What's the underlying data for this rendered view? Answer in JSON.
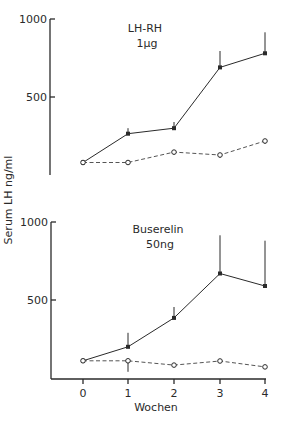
{
  "chart_data": [
    {
      "type": "line",
      "title": "LH-RH 1µg",
      "panel_label_line1": "LH-RH",
      "panel_label_line2": "1µg",
      "xlabel": "Wochen",
      "ylabel": "Serum LH ng/ml",
      "x": [
        0,
        1,
        2,
        3,
        4
      ],
      "ylim": [
        0,
        1000
      ],
      "yticks": [
        500,
        1000
      ],
      "grid": false,
      "series": [
        {
          "name": "treated",
          "style": "solid-filled",
          "values": [
            80,
            265,
            300,
            690,
            780
          ],
          "error_upper": [
            80,
            300,
            340,
            795,
            915
          ]
        },
        {
          "name": "control",
          "style": "dashed-open",
          "values": [
            80,
            80,
            147,
            128,
            218
          ],
          "error_lower": [
            80,
            80,
            130,
            110,
            200
          ]
        }
      ]
    },
    {
      "type": "line",
      "title": "Buserelin 50ng",
      "panel_label_line1": "Buserelin",
      "panel_label_line2": "50ng",
      "xlabel": "Wochen",
      "ylabel": "Serum LH ng/ml",
      "x": [
        0,
        1,
        2,
        3,
        4
      ],
      "xticks": [
        "0",
        "1",
        "2",
        "3",
        "4"
      ],
      "ylim": [
        0,
        1000
      ],
      "yticks": [
        500,
        1000
      ],
      "grid": false,
      "series": [
        {
          "name": "treated",
          "style": "solid-filled",
          "values": [
            110,
            200,
            385,
            670,
            590
          ],
          "error_upper": [
            110,
            290,
            455,
            915,
            880
          ]
        },
        {
          "name": "control",
          "style": "dashed-open",
          "values": [
            110,
            110,
            83,
            109,
            71
          ],
          "error_lower": [
            110,
            40,
            83,
            109,
            71
          ]
        }
      ]
    }
  ],
  "labels": {
    "y_axis": "Serum LH  ng/ml",
    "x_axis": "Wochen",
    "top_y_1000": "1000",
    "top_y_500": "500",
    "bottom_y_1000": "1000",
    "bottom_y_500": "500",
    "x_ticks": [
      "0",
      "1",
      "2",
      "3",
      "4"
    ],
    "top_panel_line1": "LH-RH",
    "top_panel_line2": "1µg",
    "bottom_panel_line1": "Buserelin",
    "bottom_panel_line2": "50ng"
  }
}
